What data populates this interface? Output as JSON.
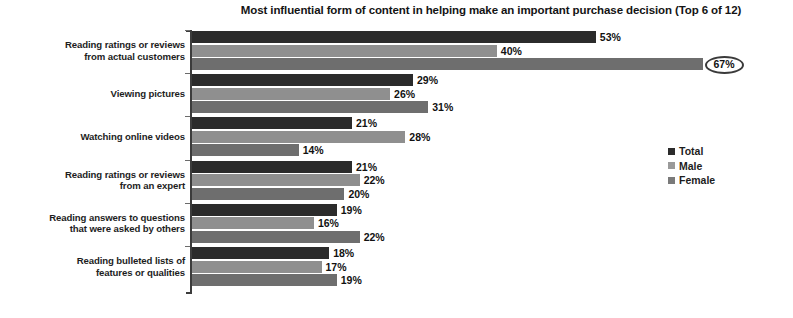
{
  "chart_data": {
    "type": "bar",
    "orientation": "horizontal",
    "title": "Most influential form of content in helping make an important purchase decision (Top 6 of 12)",
    "xlabel": "",
    "ylabel": "",
    "xlim": [
      0,
      70
    ],
    "grid": false,
    "legend_position": "right",
    "value_suffix": "%",
    "categories": [
      "Reading ratings or reviews from actual customers",
      "Viewing pictures",
      "Watching online videos",
      "Reading ratings or reviews from an expert",
      "Reading answers to questions that were asked by others",
      "Reading bulleted lists of features or qualities"
    ],
    "category_lines": [
      [
        "Reading ratings or reviews",
        "from actual customers"
      ],
      [
        "Viewing pictures"
      ],
      [
        "Watching online videos"
      ],
      [
        "Reading ratings or reviews",
        "from an expert"
      ],
      [
        "Reading answers to questions",
        "that were asked by others"
      ],
      [
        "Reading bulleted lists of",
        "features or qualities"
      ]
    ],
    "series": [
      {
        "name": "Total",
        "color": "#2b2b2b",
        "values": [
          53,
          29,
          21,
          21,
          19,
          18
        ]
      },
      {
        "name": "Male",
        "color": "#8f8f8f",
        "values": [
          40,
          26,
          28,
          22,
          16,
          17
        ]
      },
      {
        "name": "Female",
        "color": "#6e6e6e",
        "values": [
          67,
          31,
          14,
          20,
          22,
          19
        ]
      }
    ],
    "data_labels": [
      {
        "group": 0,
        "series": "Total",
        "text": "53%",
        "highlighted": false
      },
      {
        "group": 0,
        "series": "Male",
        "text": "40%",
        "highlighted": false
      },
      {
        "group": 0,
        "series": "Female",
        "text": "67%",
        "highlighted": true
      },
      {
        "group": 1,
        "series": "Total",
        "text": "29%",
        "highlighted": false
      },
      {
        "group": 1,
        "series": "Male",
        "text": "26%",
        "highlighted": false
      },
      {
        "group": 1,
        "series": "Female",
        "text": "31%",
        "highlighted": false
      },
      {
        "group": 2,
        "series": "Total",
        "text": "21%",
        "highlighted": false
      },
      {
        "group": 2,
        "series": "Male",
        "text": "28%",
        "highlighted": false
      },
      {
        "group": 2,
        "series": "Female",
        "text": "14%",
        "highlighted": false
      },
      {
        "group": 3,
        "series": "Total",
        "text": "21%",
        "highlighted": false
      },
      {
        "group": 3,
        "series": "Male",
        "text": "22%",
        "highlighted": false
      },
      {
        "group": 3,
        "series": "Female",
        "text": "20%",
        "highlighted": false
      },
      {
        "group": 4,
        "series": "Total",
        "text": "19%",
        "highlighted": false
      },
      {
        "group": 4,
        "series": "Male",
        "text": "16%",
        "highlighted": false
      },
      {
        "group": 4,
        "series": "Female",
        "text": "22%",
        "highlighted": false
      },
      {
        "group": 5,
        "series": "Total",
        "text": "18%",
        "highlighted": false
      },
      {
        "group": 5,
        "series": "Male",
        "text": "17%",
        "highlighted": false
      },
      {
        "group": 5,
        "series": "Female",
        "text": "19%",
        "highlighted": false
      }
    ],
    "annotations": [
      {
        "type": "ellipse-highlight",
        "target": "67%",
        "note": "Female value for reading ratings or reviews from actual customers is circled"
      }
    ]
  },
  "legend": {
    "items": [
      {
        "label": "Total",
        "swatch": "total"
      },
      {
        "label": "Male",
        "swatch": "male"
      },
      {
        "label": "Female",
        "swatch": "female"
      }
    ]
  }
}
